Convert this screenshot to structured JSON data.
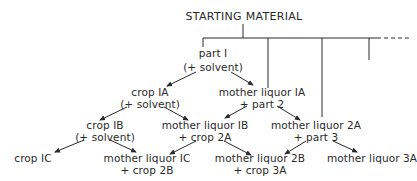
{
  "diagram": {
    "title": "STARTING MATERIAL",
    "nodes": {
      "part1": {
        "line1": "part I",
        "line2": "(+ solvent)"
      },
      "crop1A": {
        "line1": "crop IA",
        "line2": "(+ solvent)"
      },
      "ml1A": {
        "line1": "mother liquor IA",
        "line2": "+ part 2"
      },
      "crop1B": {
        "line1": "crop IB",
        "line2": "(+ solvent)"
      },
      "ml1B": {
        "line1": "mother liquor IB",
        "line2": "+ crop 2A"
      },
      "ml2A": {
        "line1": "mother liquor 2A",
        "line2": "+ part 3"
      },
      "crop1C": {
        "line1": "crop IC"
      },
      "ml1C": {
        "line1": "mother liquor IC",
        "line2": "+ crop 2B"
      },
      "ml2B": {
        "line1": "mother liquor 2B",
        "line2": "+ crop 3A"
      },
      "ml3A": {
        "line1": "mother liquor 3A"
      }
    },
    "edges": [
      [
        "STARTING MATERIAL",
        "part I"
      ],
      [
        "STARTING MATERIAL",
        "part 2"
      ],
      [
        "STARTING MATERIAL",
        "part 3"
      ],
      [
        "STARTING MATERIAL",
        "part 4 (truncated)"
      ],
      [
        "part I",
        "crop IA"
      ],
      [
        "part I",
        "mother liquor IA"
      ],
      [
        "crop IA",
        "crop IB"
      ],
      [
        "crop IA",
        "mother liquor IB"
      ],
      [
        "mother liquor IA",
        "mother liquor IB"
      ],
      [
        "mother liquor IA",
        "mother liquor 2A"
      ],
      [
        "crop IB",
        "crop IC"
      ],
      [
        "crop IB",
        "mother liquor IC"
      ],
      [
        "mother liquor IB",
        "mother liquor IC"
      ],
      [
        "mother liquor IB",
        "mother liquor 2B"
      ],
      [
        "mother liquor 2A",
        "mother liquor 2B"
      ],
      [
        "mother liquor 2A",
        "mother liquor 3A"
      ]
    ]
  }
}
